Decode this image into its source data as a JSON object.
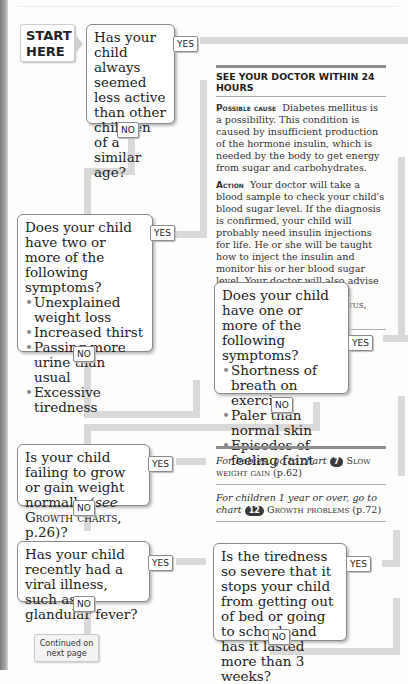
{
  "start_label": [
    "START",
    "HERE"
  ],
  "questions": {
    "q1": {
      "text": "Has your child always seemed less active than other children of a similar age?",
      "yes": "YES",
      "no": "NO"
    },
    "q2": {
      "text": "Does your child have two or more of the following symptoms?",
      "bullets": [
        "Unexplained weight loss",
        "Increased thirst",
        "Passing more urine than usual",
        "Excessive tiredness"
      ],
      "yes": "YES",
      "no": "NO"
    },
    "q3": {
      "text": "Does your child have one or more of the following symptoms?",
      "bullets": [
        "Shortness of breath on exercise",
        "Paler than normal skin",
        "Episodes of feeling faint"
      ],
      "yes": "YES",
      "no": "NO"
    },
    "q4": {
      "text_a": "Is your child failing to grow or gain weight normally (",
      "text_see": "see",
      "text_ref": " Growth charts",
      "text_b": ", p.26)?",
      "yes": "YES",
      "no": "NO"
    },
    "q5": {
      "text": "Has your child recently had a viral illness, such as glandular fever?",
      "yes": "YES",
      "no": "NO"
    },
    "q6": {
      "text": "Is the tiredness so severe that it stops your child from getting out of bed or going to school, and has it lasted more than 3 weeks?",
      "yes": "YES",
      "no": "NO"
    }
  },
  "advice": {
    "heading": "SEE YOUR DOCTOR WITHIN 24 HOURS",
    "cause_label": "Possible cause",
    "cause_text": "Diabetes mellitus is a possibility. This condition is caused by insufficient production of the hormone insulin, which is needed by the body to get energy from sugar and carbohydrates.",
    "action_label": "Action",
    "action_text": "Your doctor will take a blood sample to check your child's blood sugar level. If the diagnosis is confirmed, your child will probably need insulin injections for life. He or she will be taught how to inject the insulin and monitor his or her blood sugar level. Your doctor will also advise you on your child's diet and lifestyle (",
    "action_see": "see",
    "action_ref": " Diabetes mellitus",
    "action_end": ", p.149)."
  },
  "refs": [
    {
      "lead": "For babies, go to chart",
      "chart_no": "7",
      "title": " Slow weight gain",
      "page": " (p.62)"
    },
    {
      "lead": "For children 1 year or over, go to chart",
      "chart_no": "12",
      "title": " Growth problems",
      "page": " (p.72)"
    }
  ],
  "continued": [
    "Continued on",
    "next page"
  ]
}
